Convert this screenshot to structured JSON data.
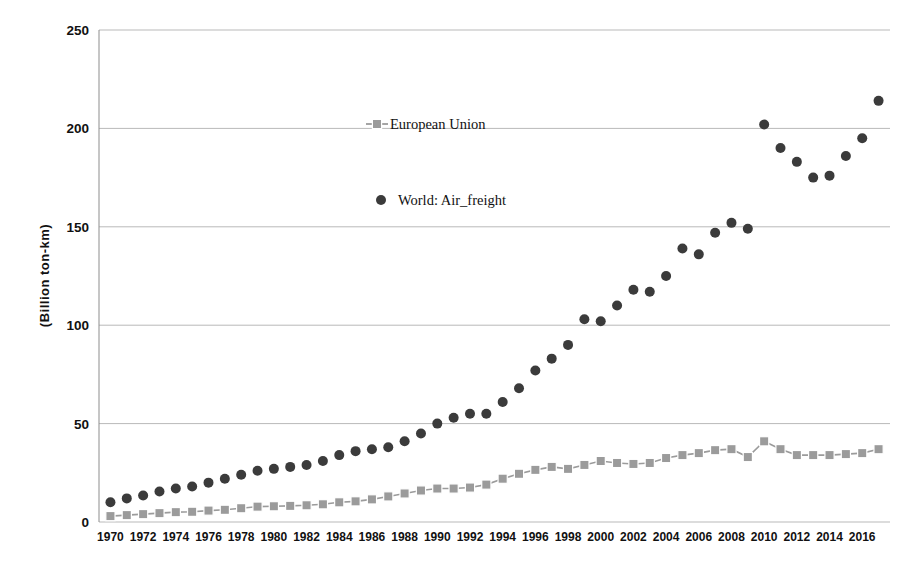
{
  "chart_data": {
    "type": "scatter",
    "title": "",
    "xlabel": "",
    "ylabel": "(Billion  ton-km)",
    "xlim": [
      1969.3,
      2017.7
    ],
    "ylim": [
      0,
      250
    ],
    "grid": true,
    "legend_position": "inside-upper-center",
    "ytick_labels": [
      "0",
      "50",
      "100",
      "150",
      "200",
      "250"
    ],
    "ytick_values": [
      0,
      50,
      100,
      150,
      200,
      250
    ],
    "xtick_labels": [
      "1970",
      "1972",
      "1974",
      "1976",
      "1978",
      "1980",
      "1982",
      "1984",
      "1986",
      "1988",
      "1990",
      "1992",
      "1994",
      "1996",
      "1998",
      "2000",
      "2002",
      "2004",
      "2006",
      "2008",
      "2010",
      "2012",
      "2014",
      "2016"
    ],
    "xtick_values": [
      1970,
      1972,
      1974,
      1976,
      1978,
      1980,
      1982,
      1984,
      1986,
      1988,
      1990,
      1992,
      1994,
      1996,
      1998,
      2000,
      2002,
      2004,
      2006,
      2008,
      2010,
      2012,
      2014,
      2016
    ],
    "x": [
      1970,
      1971,
      1972,
      1973,
      1974,
      1975,
      1976,
      1977,
      1978,
      1979,
      1980,
      1981,
      1982,
      1983,
      1984,
      1985,
      1986,
      1987,
      1988,
      1989,
      1990,
      1991,
      1992,
      1993,
      1994,
      1995,
      1996,
      1997,
      1998,
      1999,
      2000,
      2001,
      2002,
      2003,
      2004,
      2005,
      2006,
      2007,
      2008,
      2009,
      2010,
      2011,
      2012,
      2013,
      2014,
      2015,
      2016,
      2017
    ],
    "series": [
      {
        "name": "European Union",
        "marker": "square",
        "color": "#9b9b9b",
        "line": true,
        "values": [
          3,
          3.5,
          4,
          4.5,
          5,
          5.2,
          5.8,
          6.2,
          7,
          7.8,
          8,
          8.2,
          8.5,
          9,
          10,
          10.5,
          11.5,
          13,
          14.5,
          16,
          17,
          17,
          17.5,
          19,
          22,
          24.5,
          26.5,
          28,
          27,
          29,
          31,
          30,
          29.5,
          30,
          32.5,
          34,
          35,
          36.5,
          37,
          33,
          41,
          37,
          34,
          34,
          34,
          34.5,
          35,
          37
        ]
      },
      {
        "name": "World: Air_freight",
        "marker": "circle",
        "color": "#3b3b3b",
        "line": false,
        "values": [
          10,
          12,
          13.5,
          15.5,
          17,
          18,
          20,
          22,
          24,
          26,
          27,
          28,
          29,
          31,
          34,
          36,
          37,
          38,
          41,
          45,
          50,
          53,
          55,
          55,
          61,
          68,
          77,
          83,
          90,
          103,
          102,
          110,
          118,
          117,
          125,
          139,
          136,
          147,
          152,
          149,
          202,
          190,
          183,
          175,
          176,
          186,
          195,
          214
        ]
      }
    ]
  },
  "legend": {
    "items": [
      {
        "label": "European Union",
        "marker": "square-with-line",
        "color": "#9b9b9b"
      },
      {
        "label": "World: Air_freight",
        "marker": "circle",
        "color": "#3b3b3b"
      }
    ]
  },
  "axes": {
    "y_title": "(Billion  ton-km)"
  }
}
